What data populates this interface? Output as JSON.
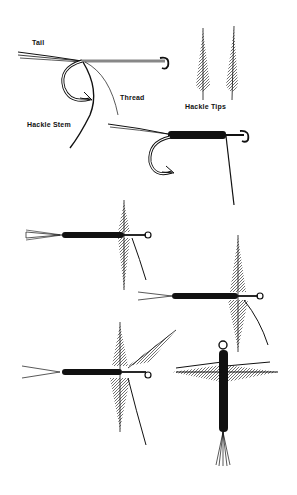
{
  "figure": {
    "ink_color": "#111111",
    "background": "#ffffff"
  },
  "labels": {
    "tail": "Tail",
    "thread": "Thread",
    "hackle_stem": "Hackle Stem",
    "hackle_tips": "Hackle Tips"
  },
  "steps": [
    {
      "id": 1,
      "name": "hook-with-tail-thread-stem"
    },
    {
      "id": 2,
      "name": "wrapped-body"
    },
    {
      "id": 3,
      "name": "hackle-wing-upright"
    },
    {
      "id": 4,
      "name": "hackle-wing-split"
    },
    {
      "id": 5,
      "name": "second-hackle-added"
    },
    {
      "id": 6,
      "name": "finished-fly-top-view"
    }
  ]
}
